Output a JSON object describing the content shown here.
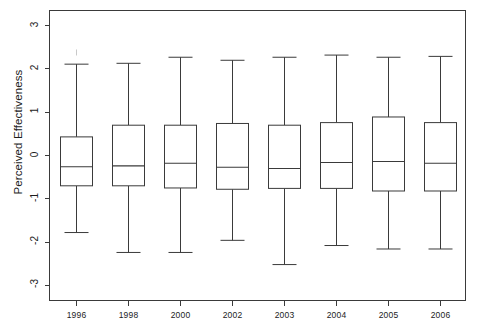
{
  "chart_data": {
    "type": "box",
    "title": "",
    "xlabel": "",
    "ylabel": "Perceived Effectiveness",
    "ylim": [
      -3.35,
      3.35
    ],
    "yticks": [
      3,
      2,
      1,
      0,
      -1,
      -2,
      -3
    ],
    "ytick_labels": [
      "3",
      "2",
      "1",
      "0",
      "-1",
      "-2",
      "-3"
    ],
    "grid": false,
    "legend": null,
    "categories": [
      "1996",
      "1998",
      "2000",
      "2002",
      "2003",
      "2004",
      "2005",
      "2006"
    ],
    "boxes": [
      {
        "category": "1996",
        "whisker_high": 2.11,
        "q3": 0.43,
        "median": -0.26,
        "q1": -0.7,
        "whisker_low": -1.78,
        "outliers": [
          2.38
        ]
      },
      {
        "category": "1998",
        "whisker_high": 2.13,
        "q3": 0.7,
        "median": -0.24,
        "q1": -0.7,
        "whisker_low": -2.24,
        "outliers": []
      },
      {
        "category": "2000",
        "whisker_high": 2.27,
        "q3": 0.7,
        "median": -0.18,
        "q1": -0.75,
        "whisker_low": -2.24,
        "outliers": []
      },
      {
        "category": "2002",
        "whisker_high": 2.2,
        "q3": 0.74,
        "median": -0.27,
        "q1": -0.78,
        "whisker_low": -1.96,
        "outliers": []
      },
      {
        "category": "2003",
        "whisker_high": 2.27,
        "q3": 0.7,
        "median": -0.3,
        "q1": -0.76,
        "whisker_low": -2.52,
        "outliers": []
      },
      {
        "category": "2004",
        "whisker_high": 2.32,
        "q3": 0.76,
        "median": -0.16,
        "q1": -0.76,
        "whisker_low": -2.08,
        "outliers": []
      },
      {
        "category": "2005",
        "whisker_high": 2.27,
        "q3": 0.89,
        "median": -0.14,
        "q1": -0.82,
        "whisker_low": -2.16,
        "outliers": []
      },
      {
        "category": "2006",
        "whisker_high": 2.29,
        "q3": 0.76,
        "median": -0.18,
        "q1": -0.82,
        "whisker_low": -2.16,
        "outliers": []
      }
    ]
  }
}
